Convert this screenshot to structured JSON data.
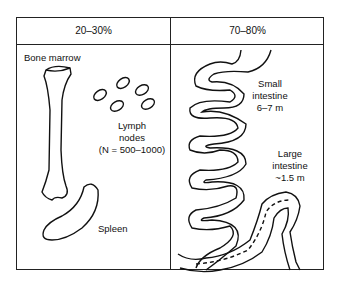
{
  "columns": [
    {
      "header": "20–30%"
    },
    {
      "header": "70–80%"
    }
  ],
  "labels": {
    "bone_marrow": "Bone marrow",
    "lymph_nodes_line1": "Lymph",
    "lymph_nodes_line2": "nodes",
    "lymph_nodes_count": "(N = 500–1000)",
    "spleen": "Spleen",
    "small_intestine_line1": "Small",
    "small_intestine_line2": "intestine",
    "small_intestine_length": "6–7 m",
    "large_intestine_line1": "Large",
    "large_intestine_line2": "intestine",
    "large_intestine_length": "~1.5 m"
  }
}
